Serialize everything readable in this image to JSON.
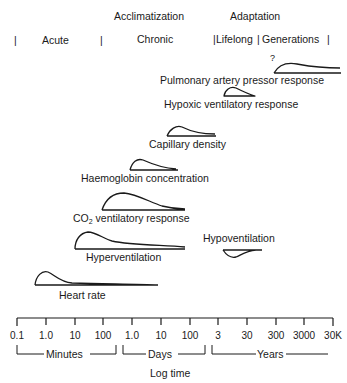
{
  "header": {
    "acclimatization": "Acclimatization",
    "adaptation": "Adaptation",
    "periods": {
      "acute": "Acute",
      "chronic": "Chronic",
      "lifelong": "Lifelong",
      "generations": "Generations"
    }
  },
  "responses": [
    {
      "id": "pulmonary",
      "label": "Pulmonary artery pressor response",
      "note": "?"
    },
    {
      "id": "hypoxic",
      "label": "Hypoxic ventilatory response"
    },
    {
      "id": "capillary",
      "label": "Capillary density"
    },
    {
      "id": "haemoglobin",
      "label": "Haemoglobin concentration"
    },
    {
      "id": "co2",
      "label_prefix": "CO",
      "label_sub": "2",
      "label_suffix": " ventilatory response"
    },
    {
      "id": "hyperventilation",
      "label": "Hyperventilation"
    },
    {
      "id": "hypoventilation",
      "label": "Hypoventilation"
    },
    {
      "id": "heart_rate",
      "label": "Heart rate"
    }
  ],
  "axis": {
    "ticks": [
      "0.1",
      "1.0",
      "10",
      "100",
      "1.0",
      "10",
      "100",
      "3",
      "30",
      "300",
      "3000",
      "30K"
    ],
    "groups": {
      "minutes": "Minutes",
      "days": "Days",
      "years": "Years"
    },
    "title": "Log time"
  }
}
